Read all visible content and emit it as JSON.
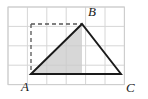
{
  "figure": {
    "kind": "geometry-diagram",
    "canvas": {
      "width": 148,
      "height": 99,
      "background": "#ffffff"
    },
    "grid": {
      "name": "square-grid",
      "origin_x": 8,
      "origin_y": 7,
      "cell": 19.4,
      "cols": 6,
      "rows": 4,
      "line_color": "#d6d6d6",
      "border_color": "#cccccc",
      "show": true
    },
    "triangle": {
      "name": "triangle-abc",
      "stroke_color": "#1a1a1a",
      "stroke_width": 1.9,
      "vertices": [
        {
          "label": "A",
          "x": 31,
          "y": 74
        },
        {
          "label": "B",
          "x": 82,
          "y": 24
        },
        {
          "label": "C",
          "x": 121,
          "y": 74
        }
      ]
    },
    "shaded_region": {
      "name": "shaded-sub-triangle",
      "fill_color": "#c9c9c9",
      "fill_opacity": 0.75,
      "points": [
        {
          "x": 31,
          "y": 74
        },
        {
          "x": 82,
          "y": 24
        },
        {
          "x": 82,
          "y": 74
        }
      ]
    },
    "dashed_lines": [
      {
        "name": "dashed-altitude-left",
        "x1": 31,
        "y1": 24,
        "x2": 31,
        "y2": 74,
        "color": "#555555",
        "dash": "4 3",
        "width": 1.3
      },
      {
        "name": "dashed-top-edge",
        "x1": 31,
        "y1": 24,
        "x2": 82,
        "y2": 24,
        "color": "#555555",
        "dash": "4 3",
        "width": 1.3
      },
      {
        "name": "dashed-bottom-edge",
        "x1": 31,
        "y1": 74,
        "x2": 82,
        "y2": 74,
        "color": "#555555",
        "dash": "4 3",
        "width": 1.3
      }
    ],
    "solid_segments": [
      {
        "name": "base-segment-right",
        "x1": 82,
        "y1": 74,
        "x2": 121,
        "y2": 74,
        "color": "#1a1a1a",
        "width": 1.9
      }
    ],
    "labels": [
      {
        "name": "label-a",
        "text": "A",
        "x": 21,
        "y": 91
      },
      {
        "name": "label-b",
        "text": "B",
        "x": 88,
        "y": 16
      },
      {
        "name": "label-c",
        "text": "C",
        "x": 126,
        "y": 92
      }
    ]
  }
}
